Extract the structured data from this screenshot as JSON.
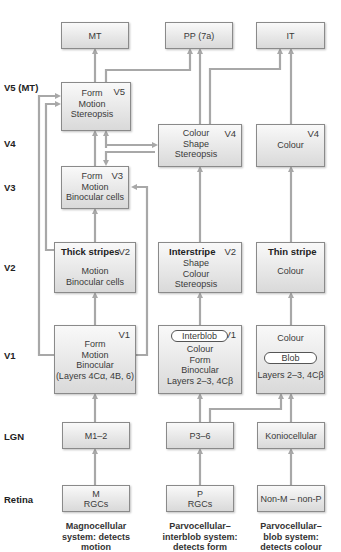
{
  "levels": {
    "v5": "V5 (MT)",
    "v4": "V4",
    "v3": "V3",
    "v2": "V2",
    "v1": "V1",
    "lgn": "LGN",
    "retina": "Retina"
  },
  "top": {
    "mt": "MT",
    "pp": "PP (7a)",
    "it": "IT"
  },
  "v5_box": {
    "tag": "V5",
    "lines": [
      "Form",
      "Motion",
      "Stereopsis"
    ]
  },
  "v4_mid": {
    "tag": "V4",
    "lines": [
      "Colour",
      "Shape",
      "Stereopsis"
    ]
  },
  "v4_right": {
    "tag": "V4",
    "lines": [
      "Colour"
    ]
  },
  "v3_box": {
    "tag": "V3",
    "lines": [
      "Form",
      "Motion",
      "Binocular cells"
    ]
  },
  "v2_thick": {
    "title": "Thick stripes",
    "tag": "V2",
    "lines": [
      "Motion",
      "Binocular cells"
    ]
  },
  "v2_inter": {
    "title": "Interstripe",
    "tag": "V2",
    "lines": [
      "Shape",
      "Colour",
      "Stereopsis"
    ]
  },
  "v2_thin": {
    "title": "Thin stripe",
    "lines": [
      "Colour"
    ]
  },
  "v1_left": {
    "tag": "V1",
    "lines": [
      "Form",
      "Motion",
      "Binocular",
      "(Layers 4Cα, 4B, 6)"
    ]
  },
  "v1_mid": {
    "pill": "Interblob",
    "tag": "V1",
    "lines": [
      "Colour",
      "Form",
      "Binocular",
      "Layers 2–3, 4Cβ"
    ]
  },
  "v1_right": {
    "top": "Colour",
    "pill": "Blob",
    "bottom": "Layers 2–3, 4Cβ"
  },
  "lgn": {
    "m": "M1–2",
    "p": "P3–6",
    "k": "Koniocellular"
  },
  "retina": {
    "m": [
      "M",
      "RGCs"
    ],
    "p": [
      "P",
      "RGCs"
    ],
    "k": "Non-M – non-P"
  },
  "captions": {
    "magno": [
      "Magnocellular",
      "system: detects motion"
    ],
    "interblob": [
      "Parvocellular–",
      "interblob system:",
      "detects form"
    ],
    "blob": [
      "Parvocellular–",
      "blob system:",
      "detects colour"
    ]
  },
  "colors": {
    "arrow": "#a8a8a8",
    "box_border": "#8a8a8a",
    "box_top": "#f9f9f9",
    "box_bottom": "#d9d9d9"
  }
}
